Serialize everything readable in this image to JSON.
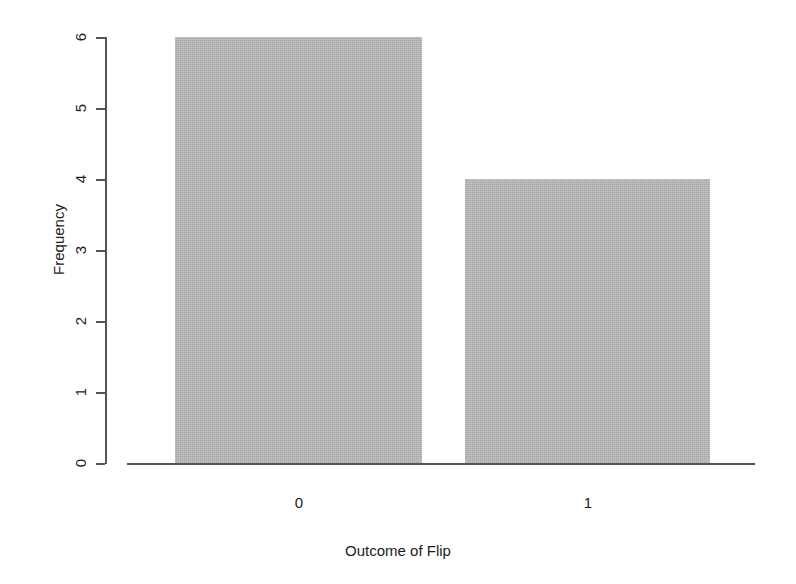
{
  "chart_data": {
    "type": "bar",
    "title": "",
    "subtitle": "",
    "xlabel": "Outcome of Flip",
    "ylabel": "Frequency",
    "categories": [
      "0",
      "1"
    ],
    "values": [
      6,
      4
    ],
    "series": [
      {
        "name": "Frequency",
        "values": [
          6,
          4
        ]
      }
    ],
    "yticks": [
      "0",
      "1",
      "2",
      "3",
      "4",
      "5",
      "6"
    ],
    "ytick_values": [
      0,
      1,
      2,
      3,
      4,
      5,
      6
    ],
    "xticks": [
      "0",
      "1"
    ],
    "ylim": [
      0,
      6
    ],
    "grid": false,
    "legend": false,
    "legend_position": "none",
    "bar_color": "#b6b6b6",
    "axis_color": "#555555",
    "text_color": "#1c1c1c",
    "background_color": "#ffffff"
  }
}
